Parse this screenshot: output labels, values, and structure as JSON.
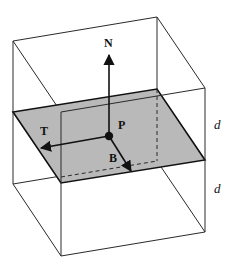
{
  "diagram": {
    "colors": {
      "edge": "#2a2a2a",
      "plane_fill": "#b9b9b9",
      "plane_edge": "#111111",
      "vector": "#111111"
    },
    "labels": {
      "normal": "N",
      "tangent": "T",
      "binormal": "B",
      "point": "P",
      "upper_half": "d",
      "lower_half": "d"
    }
  }
}
